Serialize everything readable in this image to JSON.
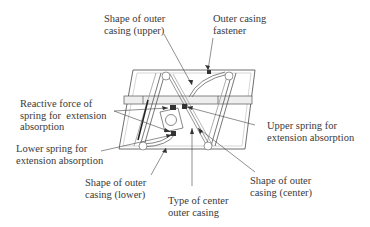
{
  "labels": {
    "upper_shape": "Shape of outer\ncasing (upper)",
    "fastener": "Outer casing\nfastener",
    "reactive_force": "Reactive force of\nspring for  extension\nabsorption",
    "upper_spring": "Upper spring for\nextension absorption",
    "lower_spring": "Lower spring for\nextension absorption",
    "lower_shape": "Shape of outer\ncasing (lower)",
    "center_type": "Type of center\nouter casing",
    "center_shape": "Shape of outer\ncasing (center)"
  },
  "colors": {
    "line": "#4a4a4a",
    "light_line": "#9a9a9a",
    "text": "#3a3a3a"
  }
}
